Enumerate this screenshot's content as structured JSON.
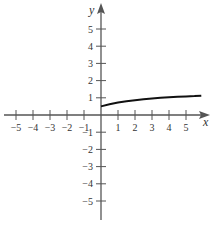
{
  "chart_data": {
    "type": "line",
    "title": "",
    "xlabel": "x",
    "ylabel": "y",
    "xlim": [
      -5.8,
      5.9
    ],
    "ylim": [
      -5.8,
      5.8
    ],
    "grid": false,
    "legend": null,
    "x_ticks": [
      -5,
      -4,
      -3,
      -2,
      -1,
      1,
      2,
      3,
      4,
      5
    ],
    "y_ticks": [
      -5,
      -4,
      -3,
      -2,
      -1,
      1,
      2,
      3,
      4,
      5
    ],
    "series": [
      {
        "name": "f(x)",
        "color": "#111111",
        "x": [
          0,
          0.5,
          1,
          1.5,
          2,
          2.5,
          3,
          3.5,
          4,
          4.5,
          5,
          5.5,
          5.9
        ],
        "values": [
          0.5,
          0.62,
          0.72,
          0.8,
          0.86,
          0.91,
          0.96,
          1.0,
          1.03,
          1.06,
          1.08,
          1.1,
          1.12
        ]
      }
    ],
    "axis_color": "#555555"
  }
}
